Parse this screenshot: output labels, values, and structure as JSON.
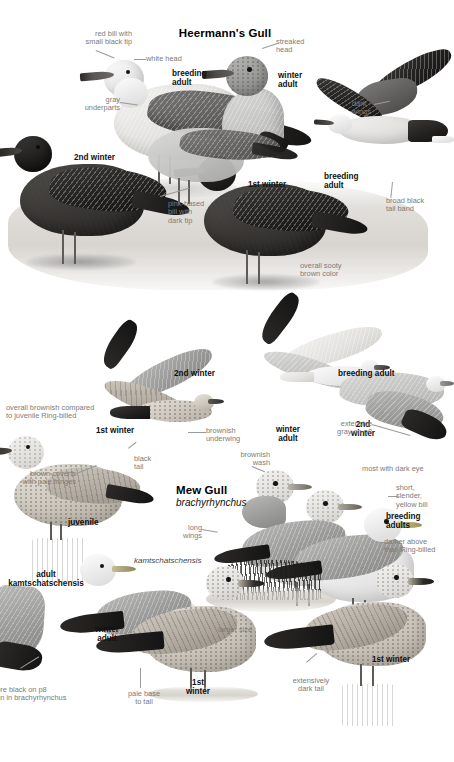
{
  "page": {
    "background": "#ffffff",
    "plate_type": "field-guide-illustration-plate",
    "panels": [
      "heermanns-gull",
      "mew-gull"
    ]
  },
  "heermanns": {
    "title": "Heermann's Gull",
    "age_labels": {
      "breeding_adult": "breeding\nadult",
      "winter_adult": "winter\nadult",
      "second_winter": "2nd winter",
      "first_winter": "1st winter",
      "breeding_adult_flight": "breeding\nadult"
    },
    "annotations": {
      "red_bill": "red bill with\nsmall black tip",
      "white_head": "white head",
      "gray_underparts": "gray\nunderparts",
      "streaked_head": "streaked\nhead",
      "dark_wings": "dark\nwings",
      "broad_black_tail_band": "broad black\ntail band",
      "pink_based_bill": "pink-based\nbill with\ndark tip",
      "sooty_brown": "overall sooty\nbrown color"
    }
  },
  "mew": {
    "title": "Mew Gull",
    "scientific_name": "brachyrhynchus",
    "subspecies_name": "kamtschatschensis",
    "age_labels": {
      "second_winter_flight": "2nd winter",
      "first_winter_flight": "1st winter",
      "breeding_adult_flight": "breeding adult",
      "winter_adult_head": "winter\nadult",
      "second_winter_head": "2nd\nwinter",
      "breeding_adults": "breeding\nadults",
      "juvenile": "juvenile",
      "adult_kamtschatschensis": "adult\nkamtschatschensis",
      "kam_winter_adult": "winter\nadult",
      "kam_first_winter": "1st\nwinter",
      "first_winter_right": "1st winter"
    },
    "annotations": {
      "overall_brownish": "overall brownish compared\nto juvenile Ring-billed",
      "brown_coverts": "brown coverts\nwith pale fringes",
      "black_tail": "black\ntail",
      "brownish_underwing": "brownish\nunderwing",
      "brownish_wash": "brownish\nwash",
      "extensive_gray_p8": "extensive\ngray on p8",
      "most_dark_eye": "most with dark eye",
      "short_slender_bill": "short,\nslender,\nyellow bill",
      "darker_above": "darker above\nthan Ring-billed",
      "long_wings": "long\nwings",
      "more_black_p8": "more black on p8\nthan in brachyrhynchus",
      "larger_size": "larger size",
      "pale_base_to_tail": "pale base\nto tail",
      "extensively_dark_tail": "extensively\ndark tail"
    }
  }
}
